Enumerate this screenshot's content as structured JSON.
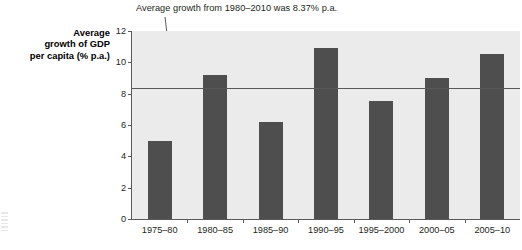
{
  "chart_data": {
    "type": "bar",
    "title": "",
    "subtitle": "",
    "xlabel": "",
    "ylabel": "Average growth of GDP per capita (% p.a.)",
    "ylabel_lines": [
      "Average",
      "growth of GDP",
      "per capita (% p.a.)"
    ],
    "categories": [
      "1975–80",
      "1980–85",
      "1985–90",
      "1990–95",
      "1995–2000",
      "2000–05",
      "2005–10"
    ],
    "values": [
      5.0,
      9.2,
      6.2,
      10.9,
      7.55,
      9.0,
      10.55
    ],
    "ylim": [
      0,
      12
    ],
    "ytick_values": [
      0,
      2,
      4,
      6,
      8,
      10,
      12
    ],
    "ytick_labels": [
      "0",
      "2",
      "4",
      "6",
      "8",
      "10",
      "12"
    ],
    "grid": false,
    "legend": "none",
    "series": [
      {
        "name": "Average growth of GDP per capita (% p.a.)",
        "values": [
          5.0,
          9.2,
          6.2,
          10.9,
          7.55,
          9.0,
          10.55
        ]
      }
    ],
    "annotations": [
      {
        "text": "Average growth from 1980–2010 was 8.37% p.a.",
        "type": "reference-line-callout",
        "value": 8.37
      }
    ],
    "reference_line": {
      "label": "Average growth from 1980–2010 was 8.37% p.a.",
      "value": 8.37,
      "color": "#58595b"
    },
    "colors": {
      "bar": "#4e4e4e",
      "plot_background": "#ebebeb",
      "axis": "#58595b",
      "text": "#231f20",
      "page_background": "#ffffff"
    }
  }
}
